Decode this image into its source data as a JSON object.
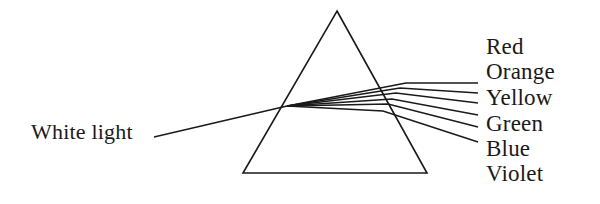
{
  "figure": {
    "name": "prism-light-dispersion-diagram",
    "background_color": "#ffffff",
    "ink_color": "#1a1a1a",
    "width": 600,
    "height": 204
  },
  "incident_beam": {
    "label": "White light",
    "label_x": 31,
    "label_y": 121,
    "line_start_x": 154,
    "line_start_y": 137,
    "line_end_x": 287,
    "line_end_y": 106
  },
  "prism": {
    "name": "triangular-prism",
    "apex_x": 337,
    "apex_y": 11,
    "base_left_x": 243,
    "base_left_y": 173,
    "base_right_x": 427,
    "base_right_y": 173,
    "stroke_width": 1.6
  },
  "dispersion": {
    "origin_x": 287,
    "origin_y": 106,
    "rays": [
      {
        "label": "Red",
        "exit_x": 406,
        "exit_y": 83,
        "end_x": 478,
        "end_y": 83
      },
      {
        "label": "Orange",
        "exit_x": 400,
        "exit_y": 88,
        "end_x": 478,
        "end_y": 93
      },
      {
        "label": "Yellow",
        "exit_x": 396,
        "exit_y": 93,
        "end_x": 478,
        "end_y": 103
      },
      {
        "label": "Green",
        "exit_x": 392,
        "exit_y": 99,
        "end_x": 478,
        "end_y": 115
      },
      {
        "label": "Blue",
        "exit_x": 388,
        "exit_y": 104,
        "end_x": 478,
        "end_y": 127
      },
      {
        "label": "Violet",
        "exit_x": 383,
        "exit_y": 111,
        "end_x": 478,
        "end_y": 142
      }
    ]
  },
  "spectrum_labels": [
    {
      "text": "Red",
      "top": 35
    },
    {
      "text": "Orange",
      "top": 60
    },
    {
      "text": "Yellow",
      "top": 86
    },
    {
      "text": "Green",
      "top": 112
    },
    {
      "text": "Blue",
      "top": 137
    },
    {
      "text": "Violet",
      "top": 162
    }
  ]
}
